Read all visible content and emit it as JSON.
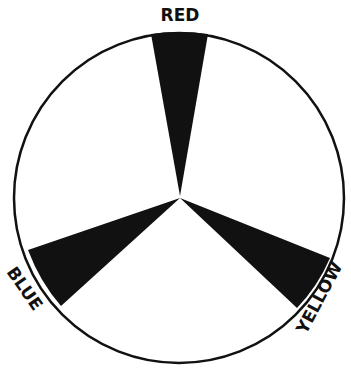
{
  "diagram": {
    "title": "",
    "shape": "circle with three black wedges meeting at center",
    "colors": {
      "outline": "#111111",
      "wedge": "#111111",
      "background": "#ffffff"
    },
    "labels": {
      "top": "RED",
      "left": "BLUE",
      "right": "YELLOW"
    },
    "wedges": [
      {
        "name": "red",
        "label": "RED",
        "direction_deg": 90
      },
      {
        "name": "blue",
        "label": "BLUE",
        "direction_deg": 210
      },
      {
        "name": "yellow",
        "label": "YELLOW",
        "direction_deg": 330
      }
    ]
  }
}
